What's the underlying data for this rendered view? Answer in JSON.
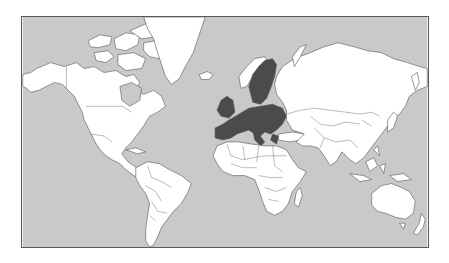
{
  "map": {
    "projection": "Mercator world map",
    "highlight_region": "European Union member states",
    "colors": {
      "ocean": "#c9c9c9",
      "land": "#ffffff",
      "highlight": "#4b4b4b",
      "highlight_neighbors_sea": "#b5b5b5",
      "border": "#555555",
      "frame": "#5a5a5a"
    },
    "regions": [
      {
        "name": "North America",
        "highlighted": false
      },
      {
        "name": "Greenland",
        "highlighted": false
      },
      {
        "name": "South America",
        "highlighted": false
      },
      {
        "name": "Europe (EU)",
        "highlighted": true
      },
      {
        "name": "Africa",
        "highlighted": false
      },
      {
        "name": "Asia",
        "highlighted": false
      },
      {
        "name": "Australia",
        "highlighted": false
      }
    ]
  }
}
